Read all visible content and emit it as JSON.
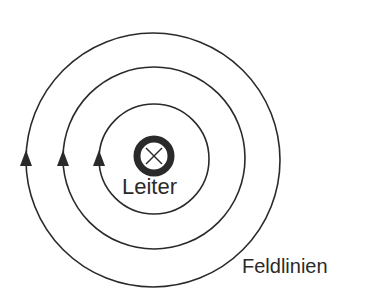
{
  "diagram": {
    "labels": {
      "conductor": "Leiter",
      "field_lines": "Feldlinien"
    },
    "conductor_symbol": "current-into-page (cross in circle)",
    "field_line_count": 3,
    "arrow_direction": "up on left side (counterclockwise)",
    "colors": {
      "line": "#2a2a2a",
      "background": "#ffffff"
    }
  }
}
